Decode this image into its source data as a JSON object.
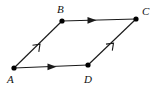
{
  "figure": {
    "type": "geometry-diagram",
    "shape_name": "parallelogram",
    "background_color": "#ffffff",
    "stroke_color": "#1a1a1a",
    "label_color": "#111111",
    "vertices": [
      {
        "id": "A",
        "label": "A",
        "x": 14,
        "y": 68,
        "label_x": 7,
        "label_y": 83
      },
      {
        "id": "B",
        "label": "B",
        "x": 62,
        "y": 21,
        "label_x": 57,
        "label_y": 13
      },
      {
        "id": "C",
        "label": "C",
        "x": 136,
        "y": 19,
        "label_x": 142,
        "label_y": 15
      },
      {
        "id": "D",
        "label": "D",
        "x": 88,
        "y": 65,
        "label_x": 84,
        "label_y": 83
      }
    ],
    "edges": [
      {
        "id": "AB",
        "from": "A",
        "to": "B",
        "arrow_style": "open",
        "arrow_t": 0.52,
        "tick_count": 1
      },
      {
        "id": "BC",
        "from": "B",
        "to": "C",
        "arrow_style": "solid",
        "arrow_t": 0.44,
        "tick_count": 1
      },
      {
        "id": "AD",
        "from": "A",
        "to": "D",
        "arrow_style": "solid",
        "arrow_t": 0.5,
        "tick_count": 1
      },
      {
        "id": "DC",
        "from": "D",
        "to": "C",
        "arrow_style": "open",
        "arrow_t": 0.53,
        "tick_count": 1
      }
    ],
    "vertex_dot_radius": 2.6
  }
}
